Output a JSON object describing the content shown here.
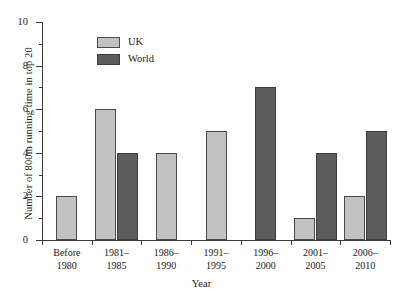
{
  "chart_data": {
    "type": "bar",
    "title": "",
    "xlabel": "Year",
    "ylabel": "Number of  800m running time in top 20",
    "ylim": [
      0,
      10
    ],
    "ytick_step": 2,
    "yticks": [
      0,
      2,
      4,
      6,
      8,
      10
    ],
    "ytick_labels": [
      "0",
      "2",
      "4",
      "6",
      "8",
      "10"
    ],
    "minor_yticks": [
      1,
      3,
      5,
      7,
      9
    ],
    "grid": false,
    "legend_position": "upper-left-inside",
    "categories": [
      "Before\n1980",
      "1981–\n1985",
      "1986–\n1990",
      "1991–\n1995",
      "1996–\n2000",
      "2001–\n2005",
      "2006–\n2010"
    ],
    "category_lines": [
      [
        "Before",
        "1980"
      ],
      [
        "1981–",
        "1985"
      ],
      [
        "1986–",
        "1990"
      ],
      [
        "1991–",
        "1995"
      ],
      [
        "1996–",
        "2000"
      ],
      [
        "2001–",
        "2005"
      ],
      [
        "2006–",
        "2010"
      ]
    ],
    "series": [
      {
        "name": "UK",
        "color": "#c2c2c2",
        "values": [
          2,
          6,
          4,
          5,
          0,
          1,
          2
        ]
      },
      {
        "name": "World",
        "color": "#5c5c5c",
        "values": [
          0,
          4,
          0,
          0,
          7,
          4,
          5
        ]
      }
    ]
  },
  "legend": {
    "items": [
      {
        "label": "UK",
        "color": "#c2c2c2"
      },
      {
        "label": "World",
        "color": "#5c5c5c"
      }
    ]
  },
  "axes": {
    "y_title": "Number of  800m running time in top 20",
    "x_title": "Year"
  }
}
